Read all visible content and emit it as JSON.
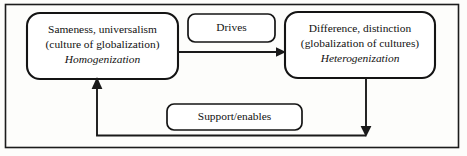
{
  "diagram": {
    "colors": {
      "stroke": "#141414",
      "background": "#fdfdfb",
      "box_fill": "#ffffff",
      "frame": "#1c1c1c"
    },
    "nodes": [
      {
        "id": "homogenization",
        "line1": "Sameness, universalism",
        "line2": "(culture of globalization)",
        "line3": "Homogenization"
      },
      {
        "id": "heterogenization",
        "line1": "Difference, distinction",
        "line2": "(globalization of cultures)",
        "line3": "Heterogenization"
      }
    ],
    "connectors": [
      {
        "id": "drives",
        "label": "Drives",
        "from": "homogenization",
        "to": "heterogenization",
        "direction": "left-to-right"
      },
      {
        "id": "support-enables",
        "label": "Support/enables",
        "from": "heterogenization",
        "to": "homogenization",
        "direction": "feedback-loop"
      }
    ]
  }
}
